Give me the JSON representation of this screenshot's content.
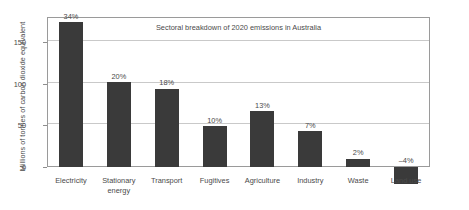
{
  "chart_data": {
    "type": "bar",
    "title": "Sectoral breakdown of 2020 emissions in Australia",
    "xlabel": "",
    "ylabel": "Millions of tonnes of carbon dioxide equivalent",
    "categories": [
      "Electricity",
      "Stationary energy",
      "Transport",
      "Fugitives",
      "Agriculture",
      "Industry",
      "Waste",
      "Land use"
    ],
    "values": [
      174,
      102,
      94,
      49,
      67,
      43,
      10,
      -20
    ],
    "data_labels": [
      "34%",
      "20%",
      "18%",
      "10%",
      "13%",
      "7%",
      "2%",
      "–4%"
    ],
    "ylim": [
      -25,
      180
    ],
    "yticks": [
      0,
      50,
      100,
      150
    ],
    "ytick_labels": [
      "0",
      "50",
      "100",
      "150"
    ],
    "grid": true,
    "legend": "none",
    "bar_color": "#3a3a3a",
    "grid_color": "#c9c9c9",
    "frame_color": "#9a9a9a"
  }
}
